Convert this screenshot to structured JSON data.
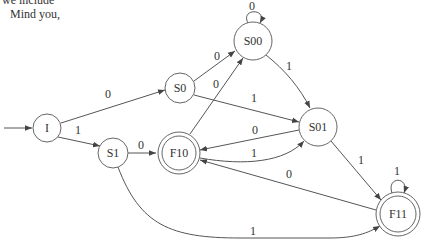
{
  "text_fragments": {
    "line1": "we include",
    "line2": "Mind you,"
  },
  "diagram": {
    "type": "finite-state-automaton",
    "start_state": "I",
    "states": [
      {
        "id": "I",
        "label": "I",
        "accepting": false
      },
      {
        "id": "S0",
        "label": "S0",
        "accepting": false
      },
      {
        "id": "S1",
        "label": "S1",
        "accepting": false
      },
      {
        "id": "S00",
        "label": "S00",
        "accepting": false
      },
      {
        "id": "S01",
        "label": "S01",
        "accepting": false
      },
      {
        "id": "F10",
        "label": "F10",
        "accepting": true
      },
      {
        "id": "F11",
        "label": "F11",
        "accepting": true
      }
    ],
    "transitions": [
      {
        "from": "I",
        "to": "S0",
        "label": "0"
      },
      {
        "from": "I",
        "to": "S1",
        "label": "1"
      },
      {
        "from": "S0",
        "to": "S00",
        "label": "0"
      },
      {
        "from": "S0",
        "to": "S01",
        "label": "1"
      },
      {
        "from": "S1",
        "to": "F10",
        "label": "0"
      },
      {
        "from": "S1",
        "to": "F11",
        "label": "1"
      },
      {
        "from": "S00",
        "to": "S00",
        "label": "0"
      },
      {
        "from": "S00",
        "to": "S01",
        "label": "1"
      },
      {
        "from": "S01",
        "to": "F10",
        "label": "0"
      },
      {
        "from": "S01",
        "to": "F11",
        "label": "1"
      },
      {
        "from": "F10",
        "to": "S00",
        "label": "0"
      },
      {
        "from": "F10",
        "to": "S01",
        "label": "1"
      },
      {
        "from": "F11",
        "to": "F10",
        "label": "0"
      },
      {
        "from": "F11",
        "to": "F11",
        "label": "1"
      }
    ]
  }
}
